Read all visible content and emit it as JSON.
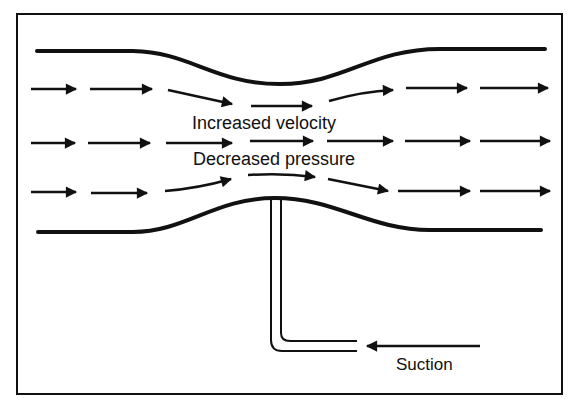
{
  "diagram": {
    "labels": {
      "velocity": "Increased velocity",
      "pressure": "Decreased pressure",
      "suction": "Suction"
    },
    "colors": {
      "ink": "#111111",
      "background": "#ffffff"
    },
    "flow_rows": [
      {
        "name": "upper-streamline",
        "arrows": 7
      },
      {
        "name": "middle-streamline",
        "arrows": 7
      },
      {
        "name": "lower-streamline",
        "arrows": 7
      }
    ],
    "parts": [
      "frame",
      "top-wall",
      "bottom-wall",
      "suction-tube",
      "suction-arrow"
    ]
  }
}
